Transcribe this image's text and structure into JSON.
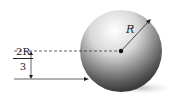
{
  "diagram": {
    "radius_label": "R",
    "height_fraction": {
      "numerator": "2R",
      "denominator": "3"
    },
    "colors": {
      "sphere_light": "#ffffff",
      "sphere_dark": "#1a1a1a",
      "line": "#222222",
      "shadow": "#cccccc"
    }
  }
}
